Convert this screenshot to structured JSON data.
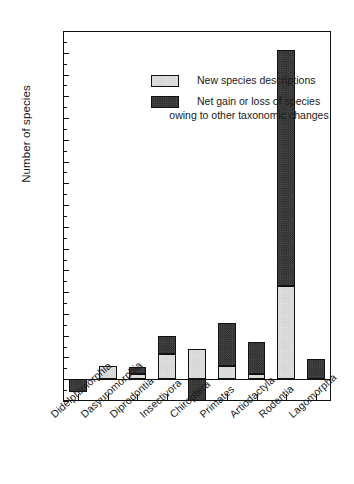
{
  "chart_data": {
    "type": "bar",
    "title": "",
    "xlabel": "",
    "ylabel": "Number of species",
    "ylim": [
      -20,
      320
    ],
    "ytick_step": 20,
    "yticks": [
      -20,
      0,
      20,
      40,
      60,
      80,
      100,
      120,
      140,
      160,
      180,
      200,
      220,
      240,
      260,
      280,
      300,
      320
    ],
    "ytick_labels": [
      "-20",
      "0",
      "20",
      "40",
      "60",
      "80",
      "100",
      "120",
      "140",
      "160",
      "180",
      "200",
      "220",
      "240",
      "260",
      "280",
      "300",
      "320"
    ],
    "grid": false,
    "stacked": true,
    "legend_position": "upper-left-inside",
    "categories": [
      "Didelphimorphia",
      "Dasyuromorphia",
      "Diprodontia",
      "Insectivora",
      "Chiroptera",
      "Primates",
      "Artiodactyla",
      "Rodentia",
      "Lagomorpha"
    ],
    "series": [
      {
        "name": "New species descriptions",
        "color": "#dcdcdc",
        "values": [
          0,
          12,
          5,
          23,
          28,
          12,
          5,
          86,
          0
        ]
      },
      {
        "name": "Net gain or loss of species owing to other taxonomic changes",
        "color": "#3a3a3a",
        "values": [
          -12,
          0,
          6,
          17,
          -20,
          40,
          29,
          217,
          19
        ]
      }
    ],
    "totals": [
      -12,
      12,
      11,
      40,
      28,
      52,
      34,
      303,
      19
    ]
  },
  "legend": {
    "entries": [
      {
        "label": "New species descriptions",
        "swatch": "light"
      },
      {
        "label": "Net gain or loss of species",
        "label2": "owing to other taxonomic changes",
        "swatch": "dark"
      }
    ]
  }
}
